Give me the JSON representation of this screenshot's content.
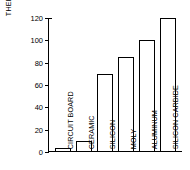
{
  "chart_data": {
    "type": "bar",
    "title": "",
    "xlabel": "",
    "ylabel": "THERMAL CONDUCTIVE (BTU/HR FT °F)",
    "ylabel_lines": [
      "THERMAL CONDUCTIVE",
      "(BTU/HR FT °F)"
    ],
    "categories": [
      "CIRCUIT BOARD",
      "CERAMIC",
      "SILICON",
      "MOLY",
      "ALUMINUM",
      "SILICON CARBIDE"
    ],
    "values": [
      4,
      10,
      70,
      85,
      100,
      120
    ],
    "ylim": [
      0,
      120
    ],
    "yticks": [
      0,
      20,
      40,
      60,
      80,
      100,
      120
    ],
    "ytick_labels": [
      "0",
      "20",
      "40",
      "60",
      "80",
      "100",
      "120"
    ],
    "grid": false,
    "legend": null,
    "bar_fill_color": "#ffffff",
    "bar_edge_color": "#000000",
    "axis_color": "#000000",
    "background_color": "#ffffff"
  }
}
